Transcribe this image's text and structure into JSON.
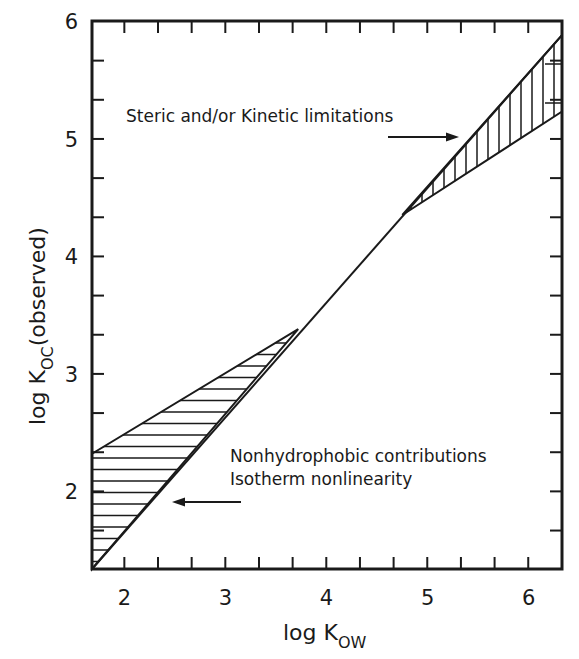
{
  "chart_data": {
    "type": "line",
    "title": "",
    "xlabel": "log K_ow",
    "xlabel_main": "log K",
    "xlabel_sub": "OW",
    "ylabel": "log K_oc(observed)",
    "ylabel_main": "log K",
    "ylabel_sub": "OC",
    "ylabel_suffix": "(observed)",
    "xlim": [
      1.68,
      6.33
    ],
    "ylim": [
      1.34,
      6.0
    ],
    "x_ticks": [
      2,
      3,
      4,
      5,
      6
    ],
    "x_tick_labels": [
      "2",
      "3",
      "4",
      "5",
      "6"
    ],
    "y_ticks": [
      2,
      3,
      4,
      5,
      6
    ],
    "y_tick_labels": [
      "2",
      "3",
      "4",
      "5",
      "6"
    ],
    "minor_tick_step": 0.333,
    "grid": false,
    "legend": null,
    "series": [
      {
        "name": "Ideal linear relation",
        "x": [
          1.68,
          6.33
        ],
        "y": [
          1.34,
          5.88
        ]
      },
      {
        "name": "Lower bound of high-Kow region (observed)",
        "x": [
          4.75,
          6.33
        ],
        "y": [
          4.35,
          5.23
        ]
      },
      {
        "name": "Upper bound of low-Kow region (observed)",
        "x": [
          1.68,
          3.72
        ],
        "y": [
          2.32,
          3.38
        ]
      }
    ],
    "shaded_regions": [
      {
        "name": "Nonhydrophobic contributions / Isotherm nonlinearity",
        "hatch": "horizontal",
        "polygon": [
          [
            1.68,
            1.34
          ],
          [
            1.68,
            2.32
          ],
          [
            3.72,
            3.38
          ]
        ]
      },
      {
        "name": "Steric and/or Kinetic limitations",
        "hatch": "vertical",
        "polygon": [
          [
            4.75,
            4.35
          ],
          [
            6.33,
            5.88
          ],
          [
            6.33,
            5.23
          ]
        ]
      }
    ],
    "annotations": [
      {
        "text": "Steric and/or Kinetic limitations",
        "arrow": "right",
        "x": 2.05,
        "y": 5.2
      },
      {
        "text": "Nonhydrophobic contributions",
        "arrow": null,
        "x": 3.05,
        "y": 2.27
      },
      {
        "text": "Isotherm nonlinearity",
        "arrow": "left",
        "x": 3.05,
        "y": 2.08
      }
    ]
  },
  "labels": {
    "x_axis_main": "log  K",
    "x_axis_sub": "OW",
    "y_axis_main": "log K",
    "y_axis_sub": "OC",
    "y_axis_suffix": "(observed)",
    "annotation_steric": "Steric and/or Kinetic limitations",
    "annotation_nonhydro": "Nonhydrophobic contributions",
    "annotation_isotherm": "Isotherm nonlinearity"
  },
  "ticks": {
    "x": [
      "2",
      "3",
      "4",
      "5",
      "6"
    ],
    "y": [
      "2",
      "3",
      "4",
      "5",
      "6"
    ]
  },
  "colors": {
    "ink": "#1a1a1a",
    "background": "#ffffff"
  }
}
